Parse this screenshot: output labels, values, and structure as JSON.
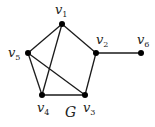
{
  "graph": {
    "title": "G",
    "title_pos": [
      65,
      117
    ],
    "edge_color": "#1a1a1a",
    "node_color": "#000000",
    "nodes": [
      {
        "id": "v1",
        "base": "v",
        "sub": "1",
        "x": 62,
        "y": 24,
        "lx": 55,
        "ly": 14
      },
      {
        "id": "v2",
        "base": "v",
        "sub": "2",
        "x": 96,
        "y": 53,
        "lx": 96,
        "ly": 44
      },
      {
        "id": "v3",
        "base": "v",
        "sub": "3",
        "x": 85,
        "y": 95,
        "lx": 83,
        "ly": 112
      },
      {
        "id": "v4",
        "base": "v",
        "sub": "4",
        "x": 42,
        "y": 95,
        "lx": 37,
        "ly": 112
      },
      {
        "id": "v5",
        "base": "v",
        "sub": "5",
        "x": 28,
        "y": 53,
        "lx": 8,
        "ly": 57
      },
      {
        "id": "v6",
        "base": "v",
        "sub": "6",
        "x": 141,
        "y": 53,
        "lx": 137,
        "ly": 44
      }
    ],
    "edges": [
      [
        "v1",
        "v5"
      ],
      [
        "v1",
        "v4"
      ],
      [
        "v1",
        "v2"
      ],
      [
        "v2",
        "v3"
      ],
      [
        "v2",
        "v6"
      ],
      [
        "v5",
        "v4"
      ],
      [
        "v5",
        "v3"
      ],
      [
        "v4",
        "v3"
      ]
    ]
  }
}
